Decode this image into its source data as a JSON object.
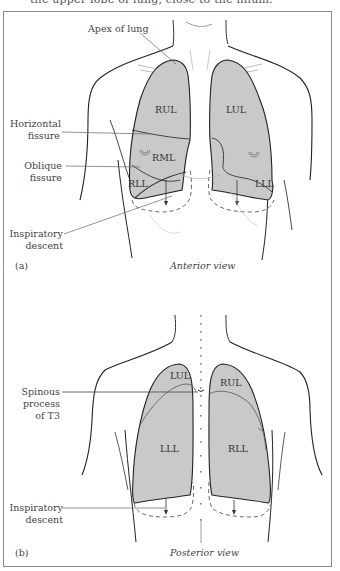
{
  "header": {
    "clipped_text": "the upper lobe of lung, close to the hilum."
  },
  "colors": {
    "lung_fill": "#c9c9c9",
    "outline": "#2a2a2a",
    "leader": "#666666",
    "frame": "#8a8a8a"
  },
  "anterior": {
    "panel_id": "(a)",
    "caption": "Anterior view",
    "labels": {
      "apex": "Apex of lung",
      "horizontal_1": "Horizontal",
      "horizontal_2": "fissure",
      "oblique_1": "Oblique",
      "oblique_2": "fissure",
      "inspiratory_1": "Inspiratory",
      "inspiratory_2": "descent"
    },
    "lobes": {
      "rul": "RUL",
      "rml": "RML",
      "rll": "RLL",
      "lul": "LUL",
      "lll": "LLL"
    }
  },
  "posterior": {
    "panel_id": "(b)",
    "caption": "Posterior view",
    "labels": {
      "spinous_1": "Spinous",
      "spinous_2": "process",
      "spinous_3": "of T3",
      "inspiratory_1": "Inspiratory",
      "inspiratory_2": "descent"
    },
    "lobes": {
      "lul": "LUL",
      "lll": "LLL",
      "rul": "RUL",
      "rll": "RLL"
    }
  }
}
